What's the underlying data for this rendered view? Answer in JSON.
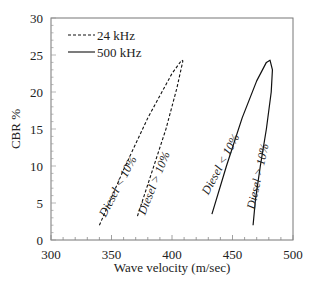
{
  "chart_data": {
    "type": "line",
    "title": "",
    "xlabel": "Wave velocity (m/sec)",
    "ylabel": "CBR %",
    "xlim": [
      300,
      500
    ],
    "ylim": [
      0,
      30
    ],
    "xticks": [
      300,
      350,
      400,
      450,
      500
    ],
    "yticks": [
      0,
      5,
      10,
      15,
      20,
      25,
      30
    ],
    "grid": false,
    "legend": {
      "position": "upper-left",
      "entries": [
        {
          "label": "24 kHz",
          "style": "dashed"
        },
        {
          "label": "500 kHz",
          "style": "solid"
        }
      ]
    },
    "series": [
      {
        "name": "24 kHz",
        "style": "dashed",
        "points": [
          [
            340,
            2.0
          ],
          [
            360,
            9.5
          ],
          [
            380,
            16.5
          ],
          [
            400,
            22.5
          ],
          [
            408,
            24.3
          ],
          [
            409,
            24.2
          ],
          [
            404,
            20.5
          ],
          [
            395,
            15.0
          ],
          [
            385,
            10.0
          ],
          [
            377,
            6.0
          ],
          [
            371,
            3.0
          ]
        ]
      },
      {
        "name": "500 kHz",
        "style": "solid",
        "points": [
          [
            433,
            3.5
          ],
          [
            445,
            10.0
          ],
          [
            458,
            16.5
          ],
          [
            470,
            21.5
          ],
          [
            478,
            24.0
          ],
          [
            481,
            24.3
          ],
          [
            483,
            23.0
          ],
          [
            482,
            20.0
          ],
          [
            478,
            15.0
          ],
          [
            473,
            10.0
          ],
          [
            469,
            5.5
          ],
          [
            467,
            2.0
          ]
        ]
      }
    ],
    "annotations": [
      {
        "text": "Diesel < 10%",
        "x": 358,
        "y": 7,
        "rotation": -62
      },
      {
        "text": "Diesel > 10%",
        "x": 388,
        "y": 7.5,
        "rotation": -68
      },
      {
        "text": "Diesel < 10%",
        "x": 443,
        "y": 10,
        "rotation": -62
      },
      {
        "text": "Diesel > 10%",
        "x": 474,
        "y": 8.5,
        "rotation": -78
      }
    ]
  }
}
